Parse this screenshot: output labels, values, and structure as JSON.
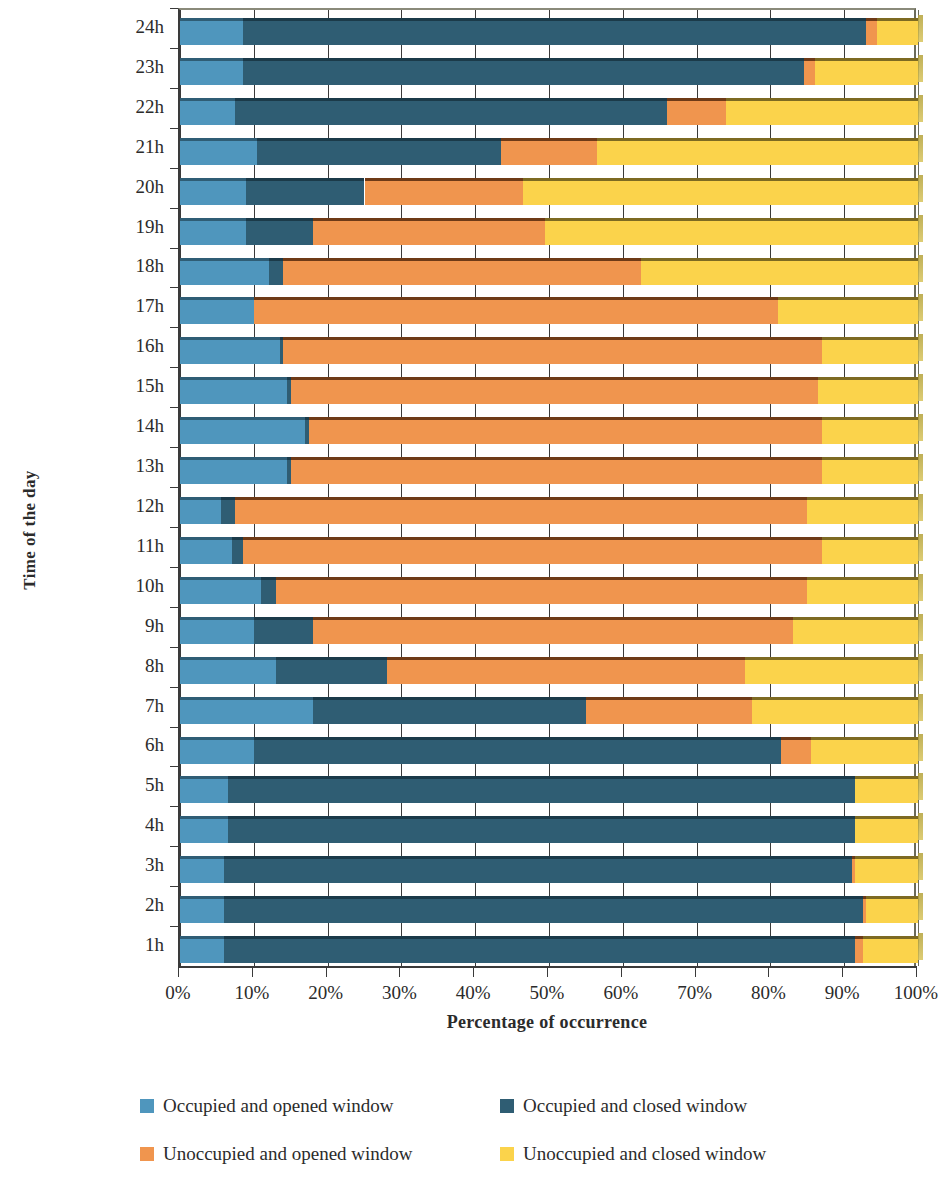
{
  "chart_data": {
    "type": "bar",
    "orientation": "horizontal",
    "stacked": true,
    "normalized_percent": true,
    "title": "",
    "xlabel": "Percentage of occurrence",
    "ylabel": "Time of the day",
    "xlim": [
      0,
      100
    ],
    "xticks": [
      "0%",
      "10%",
      "20%",
      "30%",
      "40%",
      "50%",
      "60%",
      "70%",
      "80%",
      "90%",
      "100%"
    ],
    "xtick_values": [
      0,
      10,
      20,
      30,
      40,
      50,
      60,
      70,
      80,
      90,
      100
    ],
    "grid": true,
    "legend_position": "bottom",
    "categories": [
      "1h",
      "2h",
      "3h",
      "4h",
      "5h",
      "6h",
      "7h",
      "8h",
      "9h",
      "10h",
      "11h",
      "12h",
      "13h",
      "14h",
      "15h",
      "16h",
      "17h",
      "18h",
      "19h",
      "20h",
      "21h",
      "22h",
      "23h",
      "24h"
    ],
    "series": [
      {
        "name": "Occupied and opened window",
        "color": "#4f96bd",
        "values": [
          6,
          6,
          6,
          6.5,
          6.5,
          10,
          18,
          13,
          10,
          11,
          7,
          5.5,
          14.5,
          17,
          14.5,
          13.5,
          10,
          12,
          9,
          9,
          10.5,
          7.5,
          8.5,
          8.5
        ]
      },
      {
        "name": "Occupied and closed window",
        "color": "#2f5d73",
        "values": [
          85.5,
          86.5,
          85,
          85,
          85,
          71.5,
          37,
          15,
          8,
          2,
          1.5,
          2,
          0.5,
          0.5,
          0.5,
          0.5,
          0,
          2,
          9,
          16,
          33,
          58.5,
          76,
          84.5
        ]
      },
      {
        "name": "Unoccupied and opened window",
        "color": "#f0954e",
        "values": [
          1,
          0.5,
          0.5,
          0,
          0,
          4,
          22.5,
          48.5,
          65,
          72,
          78.5,
          77.5,
          72,
          69.5,
          71.5,
          73,
          71,
          48.5,
          31.5,
          21.5,
          13,
          8,
          1.5,
          1.5
        ]
      },
      {
        "name": "Unoccupied and closed window",
        "color": "#fbd34b",
        "values": [
          7.5,
          7,
          8.5,
          8.5,
          8.5,
          14.5,
          22.5,
          23.5,
          17,
          15,
          13,
          15,
          13,
          13,
          13.5,
          13,
          19,
          37.5,
          50.5,
          53.5,
          43.5,
          26,
          14,
          5.5
        ]
      }
    ]
  },
  "legend": {
    "items": [
      {
        "label": "Occupied and opened window",
        "swatch": "s0"
      },
      {
        "label": "Occupied and closed window",
        "swatch": "s1"
      },
      {
        "label": "Unoccupied and opened window",
        "swatch": "s2"
      },
      {
        "label": "Unoccupied and closed window",
        "swatch": "s3"
      }
    ]
  }
}
